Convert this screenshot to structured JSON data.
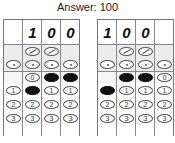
{
  "title": "Answer: 100",
  "grids": [
    {
      "name": "left-grid",
      "written": [
        "",
        "1",
        "0",
        "0"
      ],
      "columns": [
        {
          "slash": false,
          "dot": true,
          "digits": [
            null,
            "1",
            "2",
            "3"
          ],
          "filled": "1-row-none"
        },
        {
          "slash": true,
          "dot": true,
          "digits": [
            "0",
            "1",
            "2",
            "3"
          ],
          "filled": "1"
        },
        {
          "slash": true,
          "dot": true,
          "digits": [
            "0",
            "1",
            "2",
            "3"
          ],
          "filled": "0"
        },
        {
          "slash": false,
          "dot": true,
          "digits": [
            "0",
            "1",
            "2",
            "3"
          ],
          "filled": "0"
        }
      ]
    },
    {
      "name": "right-grid",
      "written": [
        "1",
        "0",
        "0",
        ""
      ],
      "columns": [
        {
          "slash": false,
          "dot": true,
          "digits": [
            null,
            "1",
            "2",
            "3"
          ],
          "filled": "1"
        },
        {
          "slash": true,
          "dot": true,
          "digits": [
            "0",
            "1",
            "2",
            "3"
          ],
          "filled": "0"
        },
        {
          "slash": true,
          "dot": true,
          "digits": [
            "0",
            "1",
            "2",
            "3"
          ],
          "filled": "0"
        },
        {
          "slash": false,
          "dot": true,
          "digits": [
            "0",
            "1",
            "2",
            "3"
          ],
          "filled": null
        }
      ]
    }
  ],
  "labels": {
    "d0": "0",
    "d1": "1",
    "d2": "2",
    "d3": "3"
  }
}
